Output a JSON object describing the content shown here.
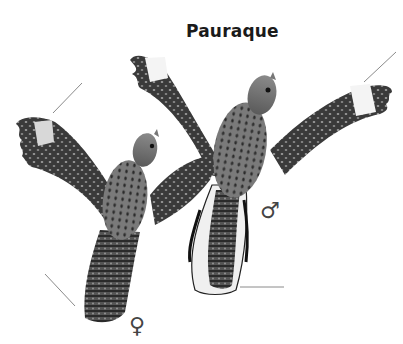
{
  "plate": {
    "title": "Pauraque",
    "birds": [
      {
        "id": "female",
        "label": "♀",
        "position": "left, lower"
      },
      {
        "id": "male",
        "label": "♂",
        "position": "right, upper"
      }
    ],
    "colors": {
      "background": "#ffffff",
      "plumage_dark": "#2e2e2e",
      "plumage_mid": "#6b6b6b",
      "plumage_light": "#a8a8a8",
      "wing_patch": "#f4f4f4",
      "leader_line": "#8a8a8a"
    }
  }
}
